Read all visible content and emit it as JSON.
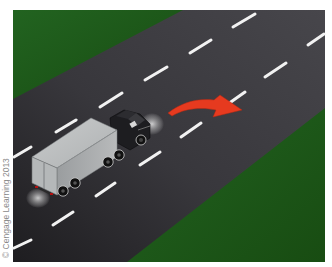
{
  "illustration": {
    "subject": "Tractor-trailer truck on a two-lane road changing lanes to the right",
    "credit": "© Cengage Learning 2013",
    "colors": {
      "grass": "#1f5c1b",
      "grass_dark": "#17480f",
      "road": "#3d3c41",
      "road_dark": "#232225",
      "lane_marking": "#f2f2f2",
      "arrow": "#e63a1f",
      "trailer": "#a9acad",
      "cab": "#1c1c1f",
      "background": "#ffffff"
    },
    "icons": {
      "arrow": "curved-right-arrow-icon"
    }
  }
}
